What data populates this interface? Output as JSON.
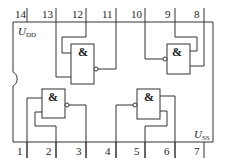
{
  "diagram": {
    "type": "ic-pinout",
    "top_pins": [
      "14",
      "13",
      "12",
      "11",
      "10",
      "9",
      "8"
    ],
    "bottom_pins": [
      "1",
      "2",
      "3",
      "4",
      "5",
      "6",
      "7"
    ],
    "supply_top": {
      "main": "U",
      "sub": "DD"
    },
    "supply_bottom": {
      "main": "U",
      "sub": "SS"
    },
    "gates": [
      {
        "id": "gate-top-left",
        "symbol": "&",
        "inputs": [
          "13",
          "12"
        ],
        "output": "11"
      },
      {
        "id": "gate-top-right",
        "symbol": "&",
        "inputs": [
          "9",
          "8"
        ],
        "output": "10"
      },
      {
        "id": "gate-bottom-left",
        "symbol": "&",
        "inputs": [
          "1",
          "2"
        ],
        "output": "3"
      },
      {
        "id": "gate-bottom-right",
        "symbol": "&",
        "inputs": [
          "5",
          "6"
        ],
        "output": "4"
      }
    ],
    "colors": {
      "line": "#333333",
      "background": "#ffffff"
    }
  }
}
